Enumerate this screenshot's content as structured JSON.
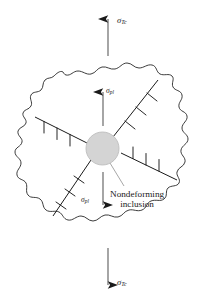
{
  "figure": {
    "name": "dislocation-pileup-at-nondeforming-inclusion",
    "background_color": "#ffffff",
    "line_color": "#1a1a1a",
    "inclusion_fill": "#d4d4d4",
    "inclusion_stroke": "#b9b9b9"
  },
  "labels": {
    "applied_stress_top": {
      "symbol": "σ",
      "subscript": "Tc"
    },
    "applied_stress_bottom": {
      "symbol": "σ",
      "subscript": "Tc"
    },
    "local_stress_top": {
      "symbol": "σ",
      "subscript": "pl"
    },
    "local_stress_bottom": {
      "symbol": "σ",
      "subscript": "pl"
    },
    "inclusion_callout_line1": "Nondeforming",
    "inclusion_callout_line2": "inclusion"
  },
  "diagram_elements": {
    "grain_boundary": "irregular wavy closed outline",
    "inclusion": "shaded circle at center",
    "slip_bands": [
      {
        "name": "upper-left-slip-band",
        "dislocation_count": 3,
        "symbol": "T"
      },
      {
        "name": "upper-right-slip-band",
        "dislocation_count": 3,
        "symbol": "T"
      },
      {
        "name": "lower-right-slip-band",
        "dislocation_count": 3,
        "symbol": "⊥"
      },
      {
        "name": "lower-left-slip-band",
        "dislocation_count": 3,
        "symbol": "⊥"
      }
    ],
    "arrows": [
      {
        "name": "applied-stress-arrow-top",
        "direction": "up"
      },
      {
        "name": "applied-stress-arrow-bottom",
        "direction": "down"
      },
      {
        "name": "local-stress-arrow-top",
        "direction": "up"
      },
      {
        "name": "local-stress-arrow-bottom",
        "direction": "down"
      }
    ],
    "leader_line": "from inclusion to callout text"
  }
}
